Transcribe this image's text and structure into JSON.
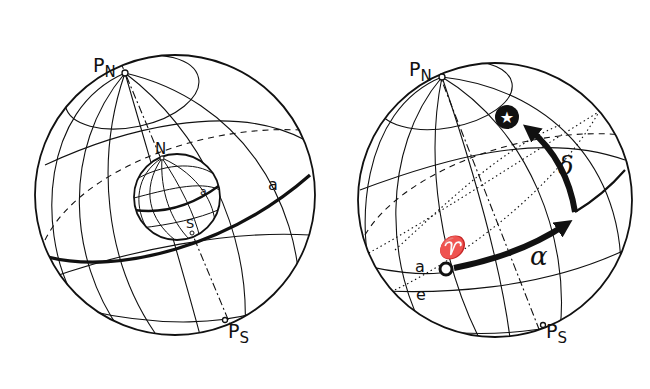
{
  "left_diagram": {
    "labels": {
      "north_celestial_pole": "P",
      "north_celestial_pole_sub": "N",
      "south_celestial_pole": "P",
      "south_celestial_pole_sub": "S",
      "earth_north": "N",
      "earth_south": "S",
      "earth_equator": "a",
      "celestial_equator": "a"
    }
  },
  "right_diagram": {
    "labels": {
      "north_celestial_pole": "P",
      "north_celestial_pole_sub": "N",
      "south_celestial_pole": "P",
      "south_celestial_pole_sub": "S",
      "celestial_equator": "a",
      "ecliptic": "e",
      "vernal_equinox": "♈",
      "right_ascension": "α",
      "declination": "δ",
      "star": "★"
    }
  },
  "colors": {
    "ink": "#111111",
    "background": "#ffffff"
  }
}
